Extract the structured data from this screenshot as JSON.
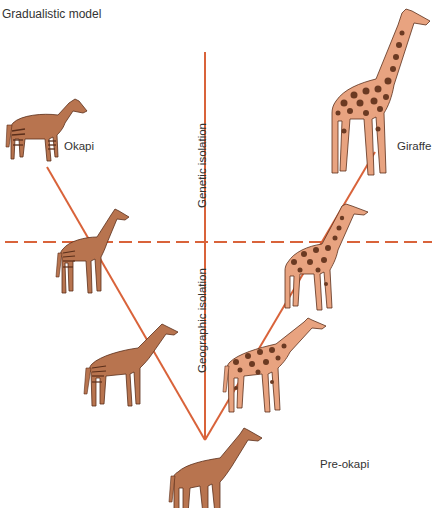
{
  "title": "Gradualistic model",
  "axes": {
    "vertical_upper_label": "Genetic isolation",
    "vertical_lower_label": "Geographic isolation"
  },
  "colors": {
    "line": "#d9633a",
    "okapi_body": "#b8744f",
    "giraffe_body": "#e8a380",
    "spots": "#6b3a22",
    "text": "#333333"
  },
  "animals": [
    {
      "name": "Okapi",
      "label": "Okapi",
      "lineage": "left",
      "stage": 4
    },
    {
      "name": "okapi-intermediate-upper",
      "label": "",
      "lineage": "left",
      "stage": 3
    },
    {
      "name": "okapi-intermediate-lower",
      "label": "",
      "lineage": "left",
      "stage": 2
    },
    {
      "name": "Giraffe",
      "label": "Giraffe",
      "lineage": "right",
      "stage": 4
    },
    {
      "name": "giraffe-intermediate-upper",
      "label": "",
      "lineage": "right",
      "stage": 3
    },
    {
      "name": "giraffe-intermediate-lower",
      "label": "",
      "lineage": "right",
      "stage": 2
    },
    {
      "name": "Pre-okapi",
      "label": "Pre-okapi",
      "lineage": "ancestor",
      "stage": 1
    }
  ]
}
